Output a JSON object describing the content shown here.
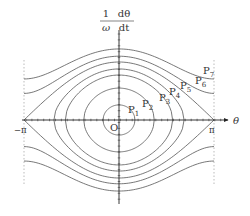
{
  "diagram": {
    "y_axis_label": {
      "numerator_left": "1",
      "denominator_left": "ω",
      "numerator_right": "dθ",
      "denominator_right": "dt"
    },
    "x_axis_label": "θ",
    "origin_label": "O",
    "tick_labels": {
      "minus_pi": "−π",
      "pi": "π"
    },
    "colors": {
      "curve": "#555555",
      "axis": "#222222",
      "dashed": "#bbbbbb",
      "text": "#333333"
    },
    "geometry": {
      "origin_x": 119,
      "origin_y": 120,
      "pi_px": 95,
      "unit_px": 29,
      "axis_x_start": 22,
      "axis_x_end": 228,
      "axis_y_top": 30,
      "axis_y_bottom": 204,
      "dashed_top": 60,
      "dashed_bottom": 184
    },
    "orbits": [
      {
        "label": "P1",
        "sub": "1",
        "amplitude": 0.52,
        "type": "closed",
        "label_x": 128,
        "label_y": 113
      },
      {
        "label": "P2",
        "sub": "2",
        "amplitude": 1.1,
        "type": "closed",
        "label_x": 142,
        "label_y": 107
      },
      {
        "label": "P3",
        "sub": "3",
        "amplitude": 1.55,
        "type": "closed",
        "label_x": 159,
        "label_y": 101
      },
      {
        "label": "P4",
        "sub": "4",
        "amplitude": 1.76,
        "type": "closed",
        "label_x": 169,
        "label_y": 95
      },
      {
        "label": "P5",
        "sub": "5",
        "amplitude": 2.0,
        "type": "separatrix",
        "label_x": 180,
        "label_y": 89
      },
      {
        "label": "P6",
        "sub": "6",
        "amplitude": 2.2,
        "type": "open",
        "label_x": 195,
        "label_y": 84
      },
      {
        "label": "P7",
        "sub": "7",
        "amplitude": 2.45,
        "type": "open",
        "label_x": 203,
        "label_y": 74
      }
    ]
  }
}
